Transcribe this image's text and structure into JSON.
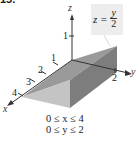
{
  "problem_number": "15.",
  "equation": {
    "lhs": "z =",
    "numerator": "y",
    "denominator": "2"
  },
  "axes": {
    "x_label": "x",
    "y_label": "y",
    "z_label": "z",
    "x_ticks": [
      "1",
      "2",
      "3",
      "4"
    ],
    "y_ticks": [
      "2"
    ],
    "z_ticks": [
      "1"
    ]
  },
  "constraints": [
    "0 ≤ x ≤ 4",
    "0 ≤ y ≤ 2"
  ],
  "colors": {
    "top_face": "#9a9a9a",
    "front_face": "#c4c4c4",
    "right_face": "#7d7d7d",
    "axis": "#333333",
    "label_box": "#ededed"
  }
}
